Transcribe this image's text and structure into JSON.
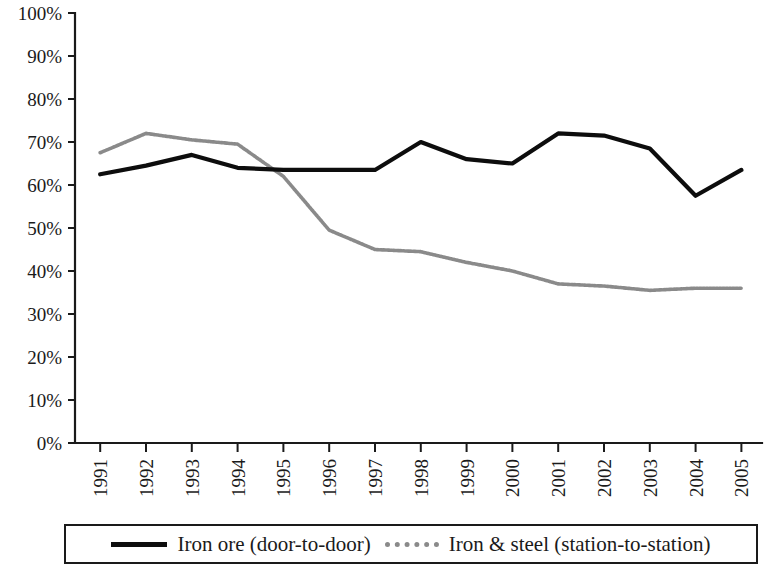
{
  "chart_data": {
    "type": "line",
    "title": "",
    "subtitle": "",
    "xlabel": "",
    "ylabel": "",
    "categories": [
      "1991",
      "1992",
      "1993",
      "1994",
      "1995",
      "1996",
      "1997",
      "1998",
      "1999",
      "2000",
      "2001",
      "2002",
      "2003",
      "2004",
      "2005"
    ],
    "x": [
      1991,
      1992,
      1993,
      1994,
      1995,
      1996,
      1997,
      1998,
      1999,
      2000,
      2001,
      2002,
      2003,
      2004,
      2005
    ],
    "series": [
      {
        "name": "Iron ore (door-to-door)",
        "color": "#0d0d0d",
        "style": "solid",
        "values": [
          62.5,
          64.5,
          67.0,
          64.0,
          63.5,
          63.5,
          63.5,
          70.0,
          66.0,
          65.0,
          72.0,
          71.5,
          68.5,
          57.5,
          63.5
        ]
      },
      {
        "name": "Iron & steel (station-to-station)",
        "color": "#8a8a8a",
        "style": "dotted",
        "values": [
          67.5,
          72.0,
          70.5,
          69.5,
          62.0,
          49.5,
          45.0,
          44.5,
          42.0,
          40.0,
          37.0,
          36.5,
          35.5,
          36.0,
          36.0
        ]
      }
    ],
    "ylim": [
      0,
      100
    ],
    "yticks": [
      0,
      10,
      20,
      30,
      40,
      50,
      60,
      70,
      80,
      90,
      100
    ],
    "ytick_labels": [
      "0%",
      "10%",
      "20%",
      "30%",
      "40%",
      "50%",
      "60%",
      "70%",
      "80%",
      "90%",
      "100%"
    ],
    "grid": false,
    "legend_position": "bottom",
    "y_unit": "%"
  },
  "legend": {
    "entries": [
      {
        "label": "Iron ore (door-to-door)",
        "swatch": "solid-black-line"
      },
      {
        "label": "Iron & steel (station-to-station)",
        "swatch": "dotted-gray-line"
      }
    ]
  }
}
